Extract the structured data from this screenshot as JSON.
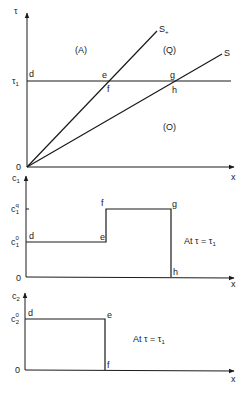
{
  "figure": {
    "top_panel": {
      "y_axis_label": "τ",
      "x_axis_label": "x",
      "origin_label": "0",
      "tau1_tick_label": "τ",
      "tau1_tick_sub": "1",
      "line_s_plus_label": "S",
      "line_s_plus_sub": "+",
      "line_s_label": "S",
      "region_A": "(A)",
      "region_Q": "(Q)",
      "region_O": "(O)",
      "point_d": "d",
      "point_e": "e",
      "point_f": "f",
      "point_g": "g",
      "point_h": "h"
    },
    "middle_panel": {
      "y_axis_label": "c",
      "y_axis_sub": "1",
      "x_axis_label": "x",
      "origin_label": "0",
      "level_q_label": "c",
      "level_q_sub": "1",
      "level_q_sup": "q",
      "level_0_label": "c",
      "level_0_sub": "1",
      "level_0_sup": "0",
      "point_d": "d",
      "point_e": "e",
      "point_f": "f",
      "point_g": "g",
      "point_h": "h",
      "annotation": "At  τ = τ",
      "annotation_sub": "1"
    },
    "bottom_panel": {
      "y_axis_label": "c",
      "y_axis_sub": "2",
      "x_axis_label": "x",
      "origin_label": "0",
      "level_0_label": "c",
      "level_0_sub": "2",
      "level_0_sup": "0",
      "point_d": "d",
      "point_e": "e",
      "point_f": "f",
      "annotation": "At  τ = τ",
      "annotation_sub": "1"
    }
  }
}
